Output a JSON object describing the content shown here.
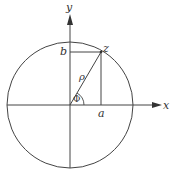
{
  "diagram": {
    "type": "complex-plane-polar-coordinates",
    "colors": {
      "stroke": "#444444",
      "text": "#333333",
      "background": "#ffffff"
    },
    "labels": {
      "x_axis": "x",
      "y_axis": "y",
      "point": "z",
      "real_part": "a",
      "imag_part": "b",
      "modulus": "ρ",
      "angle": "Φ"
    }
  }
}
